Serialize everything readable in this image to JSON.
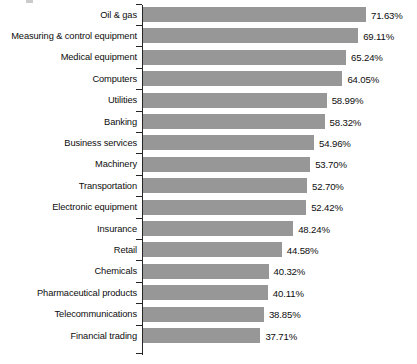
{
  "chart_data": {
    "type": "bar",
    "orientation": "horizontal",
    "title": "",
    "subtitle": "",
    "xlabel": "",
    "ylabel": "",
    "grid": false,
    "legend": false,
    "legend_position": "none",
    "value_suffix": "%",
    "xlim": [
      0,
      71.63
    ],
    "bar_color": "#979797",
    "axis_color": "#262626",
    "text_color": "#0d0d0d",
    "background": "#ffffff",
    "categories": [
      "Oil & gas",
      "Measuring & control equipment",
      "Medical equipment",
      "Computers",
      "Utilities",
      "Banking",
      "Business services",
      "Machinery",
      "Transportation",
      "Electronic equipment",
      "Insurance",
      "Retail",
      "Chemicals",
      "Pharmaceutical products",
      "Telecommunications",
      "Financial trading"
    ],
    "values": [
      71.63,
      69.11,
      65.24,
      64.05,
      58.99,
      58.32,
      54.96,
      53.7,
      52.7,
      52.42,
      48.24,
      44.58,
      40.32,
      40.11,
      38.85,
      37.71
    ],
    "value_labels": [
      "71.63%",
      "69.11%",
      "65.24%",
      "64.05%",
      "58.99%",
      "58.32%",
      "54.96%",
      "53.70%",
      "52.70%",
      "52.42%",
      "48.24%",
      "44.58%",
      "40.32%",
      "40.11%",
      "38.85%",
      "37.71%"
    ]
  }
}
